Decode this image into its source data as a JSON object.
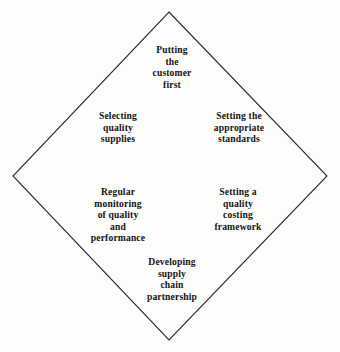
{
  "diagram": {
    "type": "diamond-framework",
    "shape": {
      "name": "diamond",
      "stroke_color": "#2b2b2b",
      "fill_color": "#fdfdfc",
      "stroke_width": 1,
      "vertices": {
        "top": [
          169,
          12
        ],
        "right": [
          327,
          176
        ],
        "bottom": [
          169,
          340
        ],
        "left": [
          13,
          176
        ]
      }
    },
    "background_color": "#fdfdfc",
    "text_color": "#15120f",
    "labels": [
      {
        "id": "top",
        "name": "putting-the-customer-first",
        "text": "Putting\nthe\ncustomer\nfirst"
      },
      {
        "id": "upper_left",
        "name": "selecting-quality-supplies",
        "text": "Selecting\nquality\nsupplies"
      },
      {
        "id": "upper_right",
        "name": "setting-the-appropriate-standards",
        "text": "Setting the\nappropriate\nstandards"
      },
      {
        "id": "lower_left",
        "name": "regular-monitoring-of-quality-and-performance",
        "text": "Regular\nmonitoring\nof quality\nand\nperformance"
      },
      {
        "id": "lower_right",
        "name": "setting-a-quality-costing-framework",
        "text": "Setting a\nquality\ncosting\nframework"
      },
      {
        "id": "bottom",
        "name": "developing-supply-chain-partnership",
        "text": "Developing\nsupply\nchain\npartnership"
      }
    ]
  }
}
